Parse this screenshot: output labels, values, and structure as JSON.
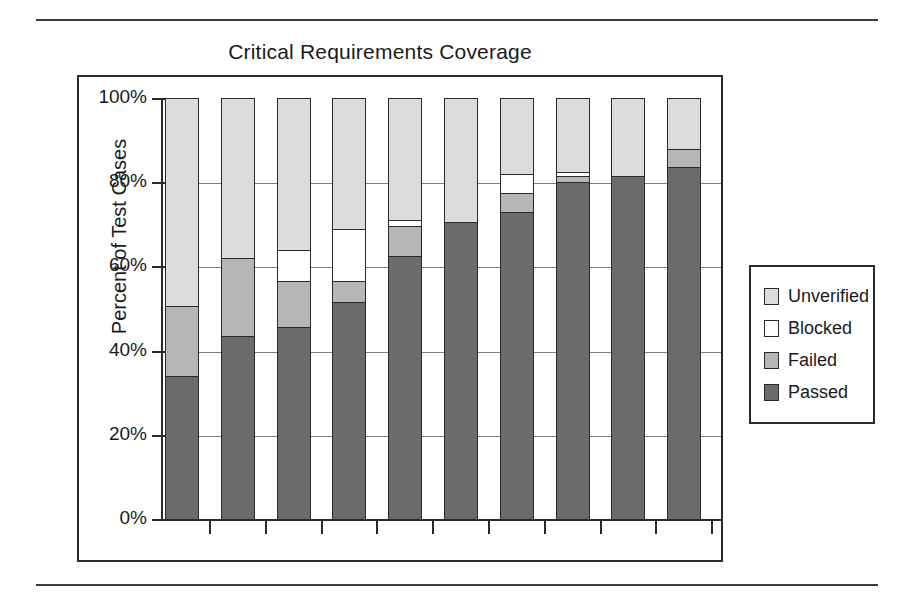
{
  "page": {
    "top_rule": "horizontal-rule",
    "bottom_rule": "horizontal-rule"
  },
  "chart_data": {
    "type": "bar",
    "stacked": true,
    "stack_mode": "percent",
    "title": "Critical Requirements Coverage",
    "xlabel": "1 Jan 00",
    "ylabel": "Percent of Test Cases",
    "ylim": [
      0,
      100
    ],
    "ytick_labels": [
      "100%",
      "80%",
      "60%",
      "40%",
      "20%",
      "0%"
    ],
    "ytick_values": [
      100,
      80,
      60,
      40,
      20,
      0
    ],
    "grid": true,
    "grid_axis": "y",
    "legend_position": "right",
    "categories": [
      "1",
      "2",
      "3",
      "4",
      "5",
      "6",
      "7",
      "8",
      "9",
      "10"
    ],
    "category_labels": [
      "1 Jan 00",
      "",
      "",
      "",
      "",
      "",
      "",
      "",
      "",
      ""
    ],
    "series": [
      {
        "name": "Passed",
        "color": "#6b6b6b",
        "values": [
          34.0,
          43.5,
          45.5,
          51.5,
          62.5,
          70.5,
          73.0,
          80.0,
          81.5,
          83.5
        ]
      },
      {
        "name": "Failed",
        "color": "#b6b6b6",
        "values": [
          16.5,
          18.5,
          11.0,
          5.0,
          7.0,
          0.0,
          4.5,
          1.5,
          0.0,
          4.5
        ]
      },
      {
        "name": "Blocked",
        "color": "#ffffff",
        "values": [
          0.0,
          0.0,
          7.5,
          12.5,
          1.5,
          0.0,
          4.5,
          1.0,
          0.0,
          0.0
        ]
      },
      {
        "name": "Unverified",
        "color": "#dcdcdc",
        "values": [
          49.5,
          38.0,
          36.0,
          31.0,
          29.0,
          29.5,
          18.0,
          17.5,
          18.5,
          12.0
        ]
      }
    ],
    "stack_order_bottom_to_top": [
      "Passed",
      "Failed",
      "Blocked",
      "Unverified"
    ],
    "legend": [
      {
        "label": "Unverified",
        "color": "#dcdcdc",
        "swatch": "unverified"
      },
      {
        "label": "Blocked",
        "color": "#ffffff",
        "swatch": "blocked"
      },
      {
        "label": "Failed",
        "color": "#b6b6b6",
        "swatch": "failed"
      },
      {
        "label": "Passed",
        "color": "#6b6b6b",
        "swatch": "passed"
      }
    ]
  }
}
